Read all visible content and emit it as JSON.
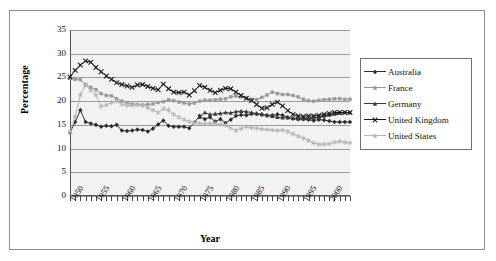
{
  "chart_data": {
    "type": "line",
    "title": "",
    "xlabel": "Year",
    "ylabel": "Percentage",
    "ylim": [
      0,
      35
    ],
    "ytick_values": [
      0,
      5,
      10,
      15,
      20,
      25,
      30,
      35
    ],
    "xlim": [
      1950,
      2004
    ],
    "xtick_labels": [
      "1950",
      "1955",
      "1960",
      "1965",
      "1970",
      "1975",
      "1980",
      "1985",
      "1990",
      "1995",
      "2000"
    ],
    "xtick_values": [
      1950,
      1955,
      1960,
      1965,
      1970,
      1975,
      1980,
      1985,
      1990,
      1995,
      2000
    ],
    "grid": true,
    "legend_position": "right",
    "x": [
      1950,
      1951,
      1952,
      1953,
      1954,
      1955,
      1956,
      1957,
      1958,
      1959,
      1960,
      1961,
      1962,
      1963,
      1964,
      1965,
      1966,
      1967,
      1968,
      1969,
      1970,
      1971,
      1972,
      1973,
      1974,
      1975,
      1976,
      1977,
      1978,
      1979,
      1980,
      1981,
      1982,
      1983,
      1984,
      1985,
      1986,
      1987,
      1988,
      1989,
      1990,
      1991,
      1992,
      1993,
      1994,
      1995,
      1996,
      1997,
      1998,
      1999,
      2000,
      2001,
      2002,
      2003,
      2004
    ],
    "series": [
      {
        "name": "Australia",
        "color": "#2b2b2b",
        "marker": "diamond",
        "values": [
          13.4,
          15.6,
          18.1,
          15.6,
          15.3,
          15.0,
          14.6,
          14.8,
          14.7,
          15.0,
          13.8,
          13.7,
          13.8,
          14.0,
          13.9,
          13.6,
          14.2,
          15.1,
          15.9,
          14.8,
          14.6,
          14.6,
          14.6,
          14.3,
          15.5,
          16.9,
          16.2,
          16.6,
          15.7,
          16.2,
          15.4,
          16.1,
          16.9,
          17.1,
          17.0,
          17.3,
          17.3,
          17.2,
          17.0,
          17.0,
          17.2,
          17.0,
          16.6,
          16.3,
          16.2,
          16.2,
          16.1,
          15.9,
          16.1,
          16.0,
          15.8,
          15.6,
          15.6,
          15.6,
          15.6
        ]
      },
      {
        "name": "France",
        "color": "#9a9a9a",
        "marker": "square",
        "values": [
          24.8,
          24.6,
          24.5,
          23.5,
          22.9,
          22.4,
          21.6,
          21.2,
          21.1,
          20.5,
          20.0,
          19.7,
          19.4,
          19.3,
          19.2,
          19.3,
          19.4,
          19.7,
          19.9,
          20.3,
          20.1,
          19.8,
          19.6,
          19.4,
          19.6,
          20.0,
          20.2,
          20.2,
          20.3,
          20.4,
          20.5,
          20.9,
          21.1,
          20.9,
          20.6,
          20.4,
          20.3,
          20.8,
          21.3,
          21.9,
          21.6,
          21.4,
          21.4,
          21.2,
          20.9,
          20.4,
          20.1,
          20.0,
          20.2,
          20.3,
          20.4,
          20.5,
          20.5,
          20.4,
          20.4
        ]
      },
      {
        "name": "Germany",
        "color": "#3a3a3a",
        "marker": "triangle",
        "values": [
          null,
          null,
          null,
          null,
          null,
          null,
          null,
          null,
          null,
          null,
          null,
          null,
          null,
          null,
          null,
          null,
          null,
          null,
          null,
          null,
          null,
          null,
          null,
          null,
          null,
          16.6,
          17.6,
          17.2,
          17.3,
          17.4,
          17.6,
          17.5,
          17.8,
          17.9,
          17.8,
          17.6,
          17.4,
          17.2,
          17.0,
          16.8,
          16.6,
          16.5,
          16.5,
          16.4,
          16.3,
          16.3,
          16.3,
          16.4,
          16.6,
          16.9,
          17.1,
          17.3,
          17.5,
          17.6,
          17.6
        ]
      },
      {
        "name": "United Kingdom",
        "color": "#1a1a1a",
        "marker": "x",
        "values": [
          25.1,
          26.5,
          27.6,
          28.5,
          28.2,
          27.1,
          26.2,
          25.3,
          24.6,
          23.9,
          23.5,
          23.2,
          22.9,
          23.4,
          23.5,
          23.1,
          22.7,
          22.4,
          23.6,
          22.6,
          21.9,
          21.8,
          21.9,
          21.3,
          22.2,
          23.3,
          22.9,
          22.3,
          21.8,
          22.3,
          22.7,
          22.6,
          21.9,
          21.2,
          20.6,
          20.1,
          19.3,
          18.5,
          18.6,
          19.3,
          19.8,
          19.0,
          18.0,
          17.2,
          16.9,
          16.8,
          16.9,
          16.9,
          17.0,
          17.2,
          17.4,
          17.6,
          17.6,
          17.6,
          17.6
        ]
      },
      {
        "name": "United States",
        "color": "#b5b5b5",
        "marker": "asterisk",
        "values": [
          13.5,
          16.7,
          21.3,
          23.4,
          22.3,
          21.3,
          18.9,
          19.2,
          19.7,
          20.0,
          19.3,
          19.1,
          19.1,
          19.2,
          19.1,
          18.6,
          18.1,
          17.6,
          18.4,
          18.1,
          17.2,
          16.6,
          16.1,
          15.7,
          15.4,
          15.3,
          15.2,
          15.3,
          15.3,
          15.1,
          14.9,
          14.3,
          13.8,
          14.2,
          14.6,
          14.4,
          14.3,
          14.1,
          14.0,
          13.9,
          13.8,
          13.9,
          13.6,
          13.1,
          12.6,
          12.2,
          11.7,
          11.2,
          10.9,
          10.9,
          11.0,
          11.3,
          11.5,
          11.3,
          11.2
        ]
      }
    ]
  }
}
